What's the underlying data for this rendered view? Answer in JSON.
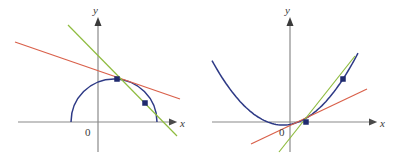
{
  "figure": {
    "width": 396,
    "height": 161,
    "background": "#ffffff"
  },
  "colors": {
    "curve": "#2e3a86",
    "axis": "#8a8a8a",
    "secant_green": "#8fbc3f",
    "tangent_red": "#d9604a",
    "point": "#1f2a6e",
    "label": "#3a3a3a"
  },
  "panels": [
    {
      "id": "left",
      "name": "semicircle-panel",
      "axes": {
        "x_label": "x",
        "y_label": "y",
        "origin_label": "0",
        "x_axis_y": 122,
        "y_axis_x": 98,
        "x_axis_start": 18,
        "x_axis_end": 178,
        "y_axis_top": 18,
        "y_axis_bottom": 152
      },
      "curve": {
        "name": "semicircle",
        "type": "semicircle",
        "center_x": 114,
        "center_y": 122,
        "radius": 43
      },
      "points": [
        {
          "name": "point-upper",
          "x": 117,
          "y": 79
        },
        {
          "name": "point-lower",
          "x": 145,
          "y": 103
        }
      ],
      "lines": [
        {
          "name": "tangent-line-red",
          "color": "#d9604a",
          "x1": 15,
          "y1": 42,
          "x2": 180,
          "y2": 99
        },
        {
          "name": "secant-line-green",
          "color": "#8fbc3f",
          "x1": 68,
          "y1": 25,
          "x2": 177,
          "y2": 136
        }
      ]
    },
    {
      "id": "right",
      "name": "parabola-panel",
      "axes": {
        "x_label": "x",
        "y_label": "y",
        "origin_label": "0",
        "x_axis_y": 122,
        "y_axis_x": 290,
        "x_axis_start": 212,
        "x_axis_end": 378,
        "y_axis_top": 18,
        "y_axis_bottom": 152
      },
      "curve": {
        "name": "parabola",
        "type": "parabola",
        "vertex_x": 283,
        "vertex_y": 125,
        "x_start": 212,
        "x_end": 358
      },
      "points": [
        {
          "name": "point-lower",
          "x": 306,
          "y": 122
        },
        {
          "name": "point-upper",
          "x": 343,
          "y": 79
        }
      ],
      "lines": [
        {
          "name": "tangent-line-red",
          "color": "#d9604a",
          "x1": 251,
          "y1": 144,
          "x2": 367,
          "y2": 89
        },
        {
          "name": "secant-line-green",
          "color": "#8fbc3f",
          "x1": 279,
          "y1": 152,
          "x2": 355,
          "y2": 56
        }
      ]
    }
  ]
}
